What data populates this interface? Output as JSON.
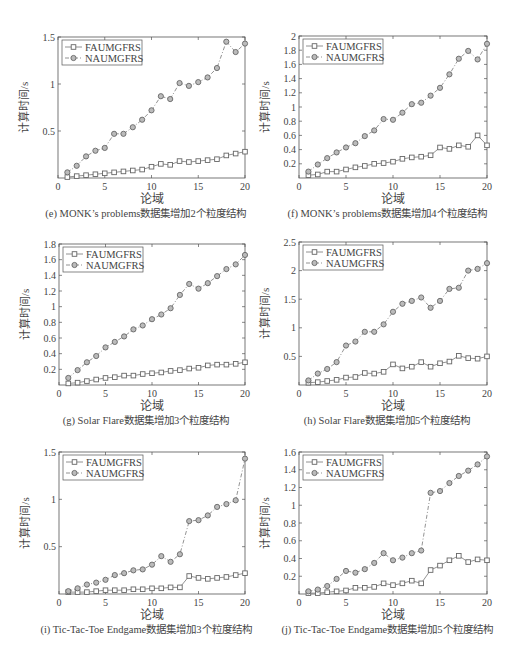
{
  "legend": {
    "series_a": "FAUMGFRS",
    "series_b": "NAUMGFRS"
  },
  "chart_data": [
    {
      "id": "e",
      "type": "line",
      "caption": "(e) MONK’s problems数据集增加2个粒度结构",
      "xlabel": "论域",
      "ylabel": "计算时间/s",
      "x": [
        1,
        2,
        3,
        4,
        5,
        6,
        7,
        8,
        9,
        10,
        11,
        12,
        13,
        14,
        15,
        16,
        17,
        18,
        19,
        20
      ],
      "xlim": [
        0,
        20
      ],
      "xticks": [
        0,
        5,
        10,
        15,
        20
      ],
      "ylim": [
        0,
        1.5
      ],
      "yticks": [
        0.5,
        1,
        1.5
      ],
      "ytick_labels": [
        "0.5",
        "1",
        "1.5"
      ],
      "legend_position": "upper left",
      "series": [
        {
          "name": "FAUMGFRS",
          "marker": "square",
          "line": "solid",
          "values": [
            0.01,
            0.02,
            0.03,
            0.04,
            0.05,
            0.06,
            0.07,
            0.08,
            0.09,
            0.12,
            0.15,
            0.14,
            0.18,
            0.17,
            0.18,
            0.19,
            0.2,
            0.24,
            0.26,
            0.28
          ]
        },
        {
          "name": "NAUMGFRS",
          "marker": "circle",
          "line": "dashdot",
          "values": [
            0.06,
            0.13,
            0.23,
            0.29,
            0.32,
            0.47,
            0.47,
            0.54,
            0.62,
            0.72,
            0.87,
            0.84,
            1.01,
            0.98,
            1.02,
            1.07,
            1.17,
            1.45,
            1.34,
            1.43
          ]
        }
      ]
    },
    {
      "id": "f",
      "type": "line",
      "caption": "(f) MONK’s problems数据集增加4个粒度结构",
      "xlabel": "论域",
      "ylabel": "计算时间/s",
      "x": [
        1,
        2,
        3,
        4,
        5,
        6,
        7,
        8,
        9,
        10,
        11,
        12,
        13,
        14,
        15,
        16,
        17,
        18,
        19,
        20
      ],
      "xlim": [
        0,
        20
      ],
      "xticks": [
        0,
        5,
        10,
        15,
        20
      ],
      "ylim": [
        0,
        2
      ],
      "yticks": [
        0.2,
        0.4,
        0.6,
        0.8,
        1,
        1.2,
        1.4,
        1.6,
        1.8,
        2
      ],
      "ytick_labels": [
        "0.2",
        "0.4",
        "0.6",
        "0.8",
        "1",
        "1.2",
        "1.4",
        "1.6",
        "1.8",
        "2"
      ],
      "legend_position": "upper left",
      "series": [
        {
          "name": "FAUMGFRS",
          "marker": "square",
          "line": "solid",
          "values": [
            0.04,
            0.05,
            0.09,
            0.09,
            0.12,
            0.15,
            0.17,
            0.2,
            0.21,
            0.23,
            0.27,
            0.29,
            0.3,
            0.32,
            0.43,
            0.41,
            0.46,
            0.44,
            0.6,
            0.46
          ]
        },
        {
          "name": "NAUMGFRS",
          "marker": "circle",
          "line": "dashdot",
          "values": [
            0.09,
            0.19,
            0.28,
            0.36,
            0.43,
            0.49,
            0.59,
            0.67,
            0.83,
            0.82,
            0.92,
            1.04,
            1.06,
            1.16,
            1.27,
            1.46,
            1.68,
            1.79,
            1.67,
            1.89
          ]
        }
      ]
    },
    {
      "id": "g",
      "type": "line",
      "caption": "(g) Solar Flare数据集增加3个粒度结构",
      "xlabel": "论域",
      "ylabel": "计算时间/s",
      "x": [
        1,
        2,
        3,
        4,
        5,
        6,
        7,
        8,
        9,
        10,
        11,
        12,
        13,
        14,
        15,
        16,
        17,
        18,
        19,
        20
      ],
      "xlim": [
        0,
        20
      ],
      "xticks": [
        0,
        5,
        10,
        15,
        20
      ],
      "ylim": [
        0,
        1.8
      ],
      "yticks": [
        0.2,
        0.4,
        0.6,
        0.8,
        1,
        1.2,
        1.4,
        1.6,
        1.8
      ],
      "ytick_labels": [
        "0.2",
        "0.4",
        "0.6",
        "0.8",
        "1",
        "1.2",
        "1.4",
        "1.6",
        "1.8"
      ],
      "legend_position": "upper left",
      "series": [
        {
          "name": "FAUMGFRS",
          "marker": "square",
          "line": "solid",
          "values": [
            0.02,
            0.03,
            0.05,
            0.07,
            0.09,
            0.1,
            0.12,
            0.12,
            0.14,
            0.15,
            0.16,
            0.18,
            0.19,
            0.21,
            0.22,
            0.25,
            0.26,
            0.26,
            0.27,
            0.29
          ]
        },
        {
          "name": "NAUMGFRS",
          "marker": "circle",
          "line": "dashdot",
          "values": [
            0.09,
            0.19,
            0.29,
            0.37,
            0.48,
            0.55,
            0.62,
            0.71,
            0.76,
            0.84,
            0.9,
            0.98,
            1.15,
            1.29,
            1.23,
            1.3,
            1.39,
            1.48,
            1.54,
            1.66
          ]
        }
      ]
    },
    {
      "id": "h",
      "type": "line",
      "caption": "(h) Solar Flare数据集增加5个粒度结构",
      "xlabel": "论域",
      "ylabel": "计算时间/s",
      "x": [
        1,
        2,
        3,
        4,
        5,
        6,
        7,
        8,
        9,
        10,
        11,
        12,
        13,
        14,
        15,
        16,
        17,
        18,
        19,
        20
      ],
      "xlim": [
        0,
        20
      ],
      "xticks": [
        0,
        5,
        10,
        15,
        20
      ],
      "ylim": [
        0,
        2.5
      ],
      "yticks": [
        0.5,
        1,
        1.5,
        2,
        2.5
      ],
      "ytick_labels": [
        "0.5",
        "1",
        "1.5",
        "2",
        "2.5"
      ],
      "legend_position": "upper left",
      "series": [
        {
          "name": "FAUMGFRS",
          "marker": "square",
          "line": "solid",
          "values": [
            0.04,
            0.05,
            0.07,
            0.09,
            0.13,
            0.14,
            0.21,
            0.2,
            0.23,
            0.36,
            0.29,
            0.32,
            0.4,
            0.32,
            0.38,
            0.41,
            0.51,
            0.47,
            0.46,
            0.5
          ]
        },
        {
          "name": "NAUMGFRS",
          "marker": "circle",
          "line": "dashdot",
          "values": [
            0.08,
            0.2,
            0.28,
            0.4,
            0.69,
            0.76,
            0.93,
            0.93,
            1.06,
            1.28,
            1.42,
            1.47,
            1.53,
            1.35,
            1.47,
            1.68,
            1.7,
            2.0,
            2.03,
            2.13
          ]
        }
      ]
    },
    {
      "id": "i",
      "type": "line",
      "caption": "(i) Tic-Tac-Toe Endgame数据集增加3个粒度结构",
      "xlabel": "论域",
      "ylabel": "计算时间/s",
      "x": [
        1,
        2,
        3,
        4,
        5,
        6,
        7,
        8,
        9,
        10,
        11,
        12,
        13,
        14,
        15,
        16,
        17,
        18,
        19,
        20
      ],
      "xlim": [
        0,
        20
      ],
      "xticks": [
        0,
        5,
        10,
        15,
        20
      ],
      "ylim": [
        0,
        1.5
      ],
      "yticks": [
        0.5,
        1,
        1.5
      ],
      "ytick_labels": [
        "0.5",
        "1",
        "1.5"
      ],
      "legend_position": "upper left",
      "series": [
        {
          "name": "FAUMGFRS",
          "marker": "square",
          "line": "solid",
          "values": [
            0.02,
            0.02,
            0.02,
            0.03,
            0.04,
            0.04,
            0.04,
            0.05,
            0.05,
            0.06,
            0.06,
            0.07,
            0.07,
            0.19,
            0.17,
            0.16,
            0.17,
            0.18,
            0.2,
            0.22
          ]
        },
        {
          "name": "NAUMGFRS",
          "marker": "circle",
          "line": "dashdot",
          "values": [
            0.03,
            0.06,
            0.1,
            0.12,
            0.15,
            0.2,
            0.22,
            0.25,
            0.26,
            0.31,
            0.4,
            0.34,
            0.42,
            0.77,
            0.78,
            0.83,
            0.92,
            0.95,
            0.99,
            1.43
          ]
        }
      ]
    },
    {
      "id": "j",
      "type": "line",
      "caption": "(j) Tic-Tac-Toe Endgame数据集增加5个粒度结构",
      "xlabel": "论域",
      "ylabel": "计算时间/s",
      "x": [
        1,
        2,
        3,
        4,
        5,
        6,
        7,
        8,
        9,
        10,
        11,
        12,
        13,
        14,
        15,
        16,
        17,
        18,
        19,
        20
      ],
      "xlim": [
        0,
        20
      ],
      "xticks": [
        0,
        5,
        10,
        15,
        20
      ],
      "ylim": [
        0,
        1.6
      ],
      "yticks": [
        0.2,
        0.4,
        0.6,
        0.8,
        1,
        1.2,
        1.4,
        1.6
      ],
      "ytick_labels": [
        "0.2",
        "0.4",
        "0.6",
        "0.8",
        "1",
        "1.2",
        "1.4",
        "1.6"
      ],
      "legend_position": "upper left",
      "series": [
        {
          "name": "FAUMGFRS",
          "marker": "square",
          "line": "solid",
          "values": [
            0.01,
            0.01,
            0.02,
            0.03,
            0.04,
            0.07,
            0.07,
            0.08,
            0.12,
            0.1,
            0.12,
            0.15,
            0.12,
            0.27,
            0.32,
            0.38,
            0.43,
            0.36,
            0.39,
            0.38
          ]
        },
        {
          "name": "NAUMGFRS",
          "marker": "circle",
          "line": "dashdot",
          "values": [
            0.03,
            0.05,
            0.09,
            0.17,
            0.26,
            0.24,
            0.28,
            0.35,
            0.46,
            0.38,
            0.41,
            0.46,
            0.49,
            1.14,
            1.16,
            1.25,
            1.33,
            1.39,
            1.46,
            1.55
          ]
        }
      ]
    }
  ],
  "layout": [
    {
      "left": 58,
      "top": 37,
      "width": 187,
      "height": 141
    },
    {
      "left": 299,
      "top": 36,
      "width": 188,
      "height": 142
    },
    {
      "left": 59,
      "top": 244,
      "width": 186,
      "height": 141
    },
    {
      "left": 299,
      "top": 242,
      "width": 188,
      "height": 143
    },
    {
      "left": 59,
      "top": 452,
      "width": 186,
      "height": 142
    },
    {
      "left": 299,
      "top": 452,
      "width": 188,
      "height": 142
    }
  ]
}
